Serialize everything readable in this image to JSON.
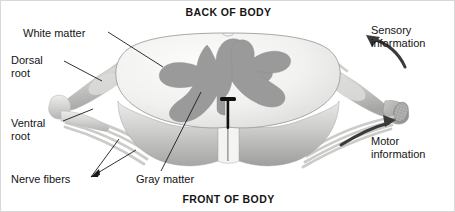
{
  "figure": {
    "title_top": "BACK OF BODY",
    "title_bottom": "FRONT OF BODY"
  },
  "labels": {
    "white_matter": "White matter",
    "dorsal_root_line1": "Dorsal",
    "dorsal_root_line2": "root",
    "ventral_root_line1": "Ventral",
    "ventral_root_line2": "root",
    "nerve_fibers": "Nerve fibers",
    "gray_matter": "Gray matter",
    "sensory_line1": "Sensory",
    "sensory_line2": "information",
    "motor_line1": "Motor",
    "motor_line2": "information"
  },
  "colors": {
    "white_matter": "#f2f2f0",
    "gray_matter": "#9a9a9a",
    "nerve_light": "#dcdcdc",
    "nerve_mid": "#c4c4c4",
    "side_wall_top": "#e2e2e0",
    "side_wall_bottom": "#a8a8a6",
    "outline": "#8a8a8a",
    "leader_line": "#1a1a1a",
    "arrow": "#3a3a3a",
    "text": "#141414",
    "frame": "#d8d8d8",
    "background": "#ffffff"
  },
  "anatomy": {
    "structures": [
      "white matter",
      "gray matter",
      "dorsal root",
      "dorsal root ganglion",
      "ventral root",
      "nerve fibers",
      "anterior median fissure"
    ],
    "arrows": [
      {
        "name": "sensory-arrow",
        "direction": "up-left",
        "meaning": "Sensory information"
      },
      {
        "name": "motor-arrow",
        "direction": "up-right",
        "meaning": "Motor information"
      }
    ]
  }
}
